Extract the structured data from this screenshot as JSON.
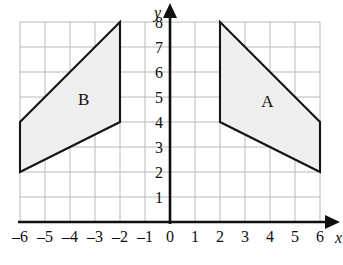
{
  "chart_data": {
    "type": "scatter",
    "title": "",
    "xlabel": "x",
    "ylabel": "y",
    "xlim": [
      -6,
      6
    ],
    "ylim": [
      0,
      8
    ],
    "grid": true,
    "legend": "none",
    "x_ticks": [
      "–6",
      "–5",
      "–4",
      "–3",
      "–2",
      "–1",
      "0",
      "1",
      "2",
      "3",
      "4",
      "5",
      "6"
    ],
    "x_tick_values": [
      -6,
      -5,
      -4,
      -3,
      -2,
      -1,
      0,
      1,
      2,
      3,
      4,
      5,
      6
    ],
    "y_ticks": [
      "1",
      "2",
      "3",
      "4",
      "5",
      "6",
      "7",
      "8"
    ],
    "y_tick_values": [
      1,
      2,
      3,
      4,
      5,
      6,
      7,
      8
    ],
    "shapes": [
      {
        "name": "A",
        "label": "A",
        "label_position": [
          3.9,
          4.6
        ],
        "vertices": [
          [
            2,
            8
          ],
          [
            6,
            4
          ],
          [
            6,
            2
          ],
          [
            2,
            4
          ]
        ],
        "fill": "#efefef",
        "stroke": "#141414"
      },
      {
        "name": "B",
        "label": "B",
        "label_position": [
          -3.45,
          4.7
        ],
        "vertices": [
          [
            -2,
            8
          ],
          [
            -6,
            4
          ],
          [
            -6,
            2
          ],
          [
            -2,
            4
          ]
        ],
        "fill": "#efefef",
        "stroke": "#141414"
      }
    ],
    "axis_arrows": [
      "x-positive",
      "y-positive"
    ],
    "grid_color": "#b9b9b9",
    "axis_color": "#101010",
    "background": "#ffffff"
  },
  "figure": {
    "x_axis_name": "x",
    "y_axis_name": "y"
  }
}
